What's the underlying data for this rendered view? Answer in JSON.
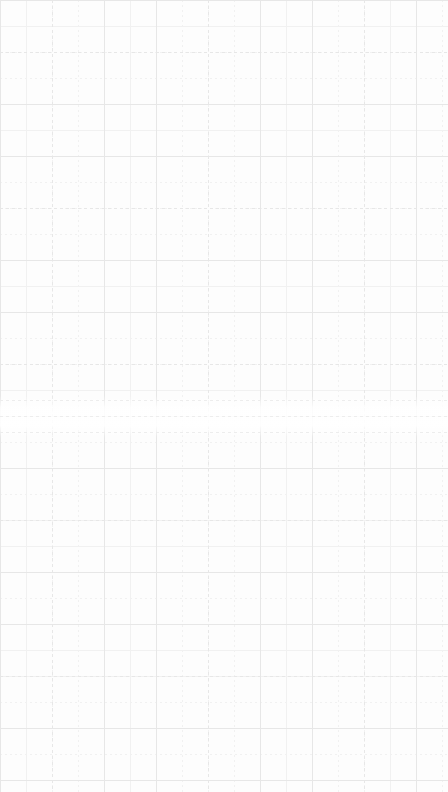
{
  "canvas": {
    "name": "blank-grid-canvas",
    "width": 448,
    "height": 792,
    "background_color": "#fdfdfd",
    "content_text": "",
    "description": "Empty dashed graph-paper grid surface with no text, icons, or controls."
  },
  "grid": {
    "minor": {
      "spacing_px": 26,
      "color": "#f1f1f1",
      "style": "dashed",
      "dash_on_px": 2,
      "dash_off_px": 3,
      "line_width_px": 1
    },
    "major": {
      "spacing_px": 52,
      "color": "#e7e7e7",
      "style": "dashed",
      "dash_on_px": 3,
      "dash_off_px": 3,
      "line_width_px": 1
    },
    "origin_x_px": 0,
    "origin_y_px": 0
  },
  "fade_band": {
    "top_px": 396,
    "height_px": 42,
    "note": "Region where vertical rules fade out while horizontal rules persist."
  },
  "band_rules": [
    {
      "y_px": 400,
      "color": "#ededed"
    },
    {
      "y_px": 416,
      "color": "#ededed"
    },
    {
      "y_px": 432,
      "color": "#ededed"
    }
  ]
}
